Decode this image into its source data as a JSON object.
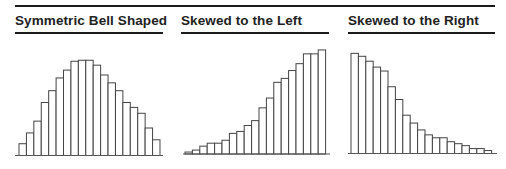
{
  "chart_data": [
    {
      "type": "bar",
      "title": "Symmetric Bell Shaped",
      "xlabel": "",
      "ylabel": "",
      "categories": [
        "1",
        "2",
        "3",
        "4",
        "5",
        "6",
        "7",
        "8",
        "9",
        "10",
        "11",
        "12",
        "13",
        "14",
        "15",
        "16",
        "17",
        "18",
        "19"
      ],
      "values": [
        12,
        23,
        35,
        54,
        66,
        79,
        87,
        96,
        97,
        97,
        92,
        82,
        74,
        66,
        54,
        49,
        43,
        28,
        16
      ],
      "ylim": [
        0,
        110
      ],
      "grid": false,
      "legend": "none",
      "bar_style": "outlined histogram"
    },
    {
      "type": "bar",
      "title": "Skewed to the Left",
      "xlabel": "",
      "ylabel": "",
      "categories": [
        "1",
        "2",
        "3",
        "4",
        "5",
        "6",
        "7",
        "8",
        "9",
        "10",
        "11",
        "12",
        "13",
        "14",
        "15",
        "16",
        "17",
        "18",
        "19"
      ],
      "values": [
        2,
        4,
        8,
        11,
        11,
        14,
        21,
        23,
        29,
        34,
        47,
        57,
        73,
        77,
        85,
        92,
        102,
        102,
        106
      ],
      "ylim": [
        0,
        110
      ],
      "grid": false,
      "legend": "none",
      "bar_style": "outlined histogram"
    },
    {
      "type": "bar",
      "title": "Skewed to the Right",
      "xlabel": "",
      "ylabel": "",
      "categories": [
        "1",
        "2",
        "3",
        "4",
        "5",
        "6",
        "7",
        "8",
        "9",
        "10",
        "11",
        "12",
        "13",
        "14",
        "15",
        "16",
        "17",
        "18",
        "19"
      ],
      "values": [
        102,
        99,
        94,
        88,
        84,
        68,
        55,
        39,
        31,
        24,
        19,
        16,
        16,
        12,
        10,
        8,
        5,
        5,
        3
      ],
      "ylim": [
        0,
        110
      ],
      "grid": false,
      "legend": "none",
      "bar_style": "outlined histogram"
    }
  ],
  "colors": {
    "rule": "#1a1a1a",
    "bar_fill": "#ffffff",
    "bar_stroke": "#444444",
    "text": "#222222"
  }
}
